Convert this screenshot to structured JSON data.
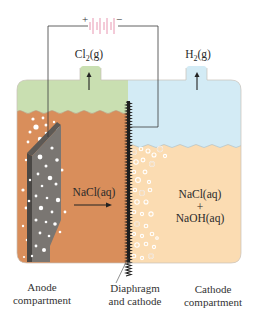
{
  "diagram": {
    "type": "chlor-alkali diaphragm electrolysis cell",
    "battery": {
      "positive_sign": "+",
      "negative_sign": "−",
      "color": "#e58aa8"
    },
    "gases": {
      "anode_gas": {
        "formula": "Cl",
        "subscript": "2",
        "state": "(g)"
      },
      "cathode_gas": {
        "formula": "H",
        "subscript": "2",
        "state": "(g)"
      }
    },
    "solutions": {
      "anode_solution": "NaCl(aq)",
      "cathode_solution_line1": "NaCl(aq)",
      "cathode_solution_plus": "+",
      "cathode_solution_line2": "NaOH(aq)"
    },
    "labels": {
      "anode_line1": "Anode",
      "anode_line2": "compartment",
      "diaphragm_line1": "Diaphragm",
      "diaphragm_line2": "and cathode",
      "cathode_line1": "Cathode",
      "cathode_line2": "compartment"
    },
    "colors": {
      "anode_gas_space": "#c9dfb1",
      "cathode_gas_space": "#d3ebf5",
      "anode_liquid": "#d98e5b",
      "cathode_liquid": "#fbdcb2",
      "electrode": "#7a7672",
      "wire": "#333333"
    }
  }
}
